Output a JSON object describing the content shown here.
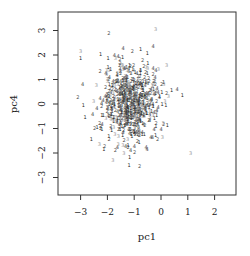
{
  "chart_data": {
    "type": "scatter",
    "title": "",
    "xlabel": "pc1",
    "ylabel": "pc4",
    "x_ticks": [
      -3,
      -2,
      -1,
      0,
      1,
      2
    ],
    "y_ticks": [
      -3,
      -2,
      -1,
      0,
      1,
      2,
      3
    ],
    "xlim": [
      -3.8,
      2.8
    ],
    "ylim": [
      -3.7,
      3.7
    ],
    "grid": false,
    "legend": "none",
    "marker": "digit labels 1-4 (group ids), gray shades",
    "groups": [
      "1",
      "2",
      "3",
      "4"
    ],
    "group_colors": [
      "#222222",
      "#555555",
      "#999999",
      "#444444"
    ],
    "cluster": {
      "n_points": 650,
      "center": [
        -1.1,
        0.0
      ],
      "sd": [
        0.55,
        0.8
      ],
      "seed": 17
    },
    "outliers": [
      {
        "x": -3.0,
        "y": 2.1,
        "label": "3"
      },
      {
        "x": -3.0,
        "y": 1.8,
        "label": "1"
      },
      {
        "x": -3.1,
        "y": 0.2,
        "label": "2"
      },
      {
        "x": -2.9,
        "y": -0.1,
        "label": "1"
      },
      {
        "x": -2.6,
        "y": -1.5,
        "label": "1"
      },
      {
        "x": -2.3,
        "y": -1.7,
        "label": "3"
      },
      {
        "x": -2.1,
        "y": -1.8,
        "label": "2"
      },
      {
        "x": -0.8,
        "y": -2.6,
        "label": "2"
      },
      {
        "x": -0.2,
        "y": 3.0,
        "label": "3"
      },
      {
        "x": 0.4,
        "y": 0.5,
        "label": "1"
      },
      {
        "x": 0.8,
        "y": 0.3,
        "label": "1"
      },
      {
        "x": 1.1,
        "y": -2.1,
        "label": "3"
      },
      {
        "x": 0.0,
        "y": -1.1,
        "label": "4"
      },
      {
        "x": -0.3,
        "y": 2.3,
        "label": "4"
      },
      {
        "x": -1.6,
        "y": 1.9,
        "label": "4"
      }
    ]
  },
  "axes": {
    "xlabel": "pc1",
    "ylabel": "pc4",
    "x_tick_labels": [
      "−3",
      "−2",
      "−1",
      "0",
      "1",
      "2"
    ],
    "y_tick_labels": [
      "−3",
      "−2",
      "−1",
      "0",
      "1",
      "2",
      "3"
    ]
  },
  "layout": {
    "plot_left": 58,
    "plot_top": 12,
    "plot_right": 236,
    "plot_bottom": 195,
    "x0_px": 161,
    "x_unit_px": 26.8,
    "y0_px": 104,
    "y_unit_px": 24.5
  }
}
